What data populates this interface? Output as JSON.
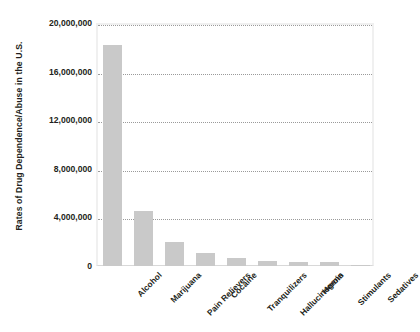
{
  "chart_data": {
    "type": "bar",
    "title": "",
    "subtitle": "",
    "xlabel": "",
    "ylabel": "Rates of Drug Dependence/Abuse in the U.S.",
    "categories": [
      "Alcohol",
      "Marijuana",
      "Pain Relievers",
      "Cocaine",
      "Tranquilizers",
      "Hallucinogens",
      "Heroin",
      "Stimulants",
      "Sedatives"
    ],
    "values": [
      18200000,
      4500000,
      2000000,
      1100000,
      700000,
      400000,
      350000,
      350000,
      100000
    ],
    "ylim": [
      0,
      20000000
    ],
    "ytick_values": [
      0,
      4000000,
      8000000,
      12000000,
      16000000,
      20000000
    ],
    "ytick_labels": [
      "0",
      "4,000,000",
      "8,000,000",
      "12,000,000",
      "16,000,000",
      "20,000,000"
    ],
    "grid": true,
    "grid_axis": "y",
    "grid_style": "dotted",
    "legend": false,
    "legend_position": "none",
    "bar_color": "#c9c9c9",
    "grid_color": "#9a9a9a",
    "frame_color": "#f0f0f0",
    "text_color": "#231f20",
    "xtick_rotation": -45
  }
}
